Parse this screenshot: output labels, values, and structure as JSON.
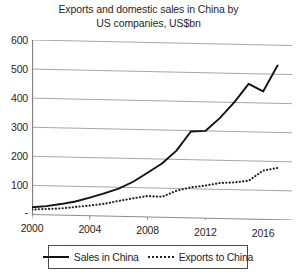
{
  "chart_data": {
    "type": "line",
    "title": "Exports and domestic sales in China by US companies, US$bn",
    "title_line1": "Exports and domestic sales in China by",
    "title_line2": "US companies, US$bn",
    "xlabel": "",
    "ylabel": "",
    "unit": "US$bn",
    "grid": true,
    "legend_position": "bottom",
    "xlim": [
      2000,
      2018
    ],
    "ylim": [
      0,
      600
    ],
    "yticks": [
      0,
      100,
      200,
      300,
      400,
      500,
      600
    ],
    "ytick_labels": [
      "-",
      "100",
      "200",
      "300",
      "400",
      "500",
      "600"
    ],
    "xticks": [
      2000,
      2004,
      2008,
      2012,
      2016
    ],
    "xtick_labels": [
      "2000",
      "2004",
      "2008",
      "2012",
      "2016"
    ],
    "x": [
      2000,
      2001,
      2002,
      2003,
      2004,
      2005,
      2006,
      2007,
      2008,
      2009,
      2010,
      2011,
      2012,
      2013,
      2014,
      2015,
      2016,
      2017
    ],
    "series": [
      {
        "name": "Sales in China",
        "style": "solid",
        "color": "#111111",
        "values": [
          25,
          30,
          38,
          48,
          62,
          78,
          95,
          120,
          152,
          185,
          230,
          297,
          300,
          345,
          400,
          465,
          440,
          530
        ]
      },
      {
        "name": "Exports to China",
        "style": "dotted",
        "color": "#262626",
        "values": [
          17,
          20,
          23,
          29,
          35,
          42,
          53,
          63,
          72,
          70,
          92,
          105,
          112,
          122,
          125,
          132,
          168,
          178
        ]
      }
    ],
    "legend": [
      {
        "label": "Sales in China",
        "style": "solid"
      },
      {
        "label": "Exports to China",
        "style": "dotted"
      }
    ]
  }
}
